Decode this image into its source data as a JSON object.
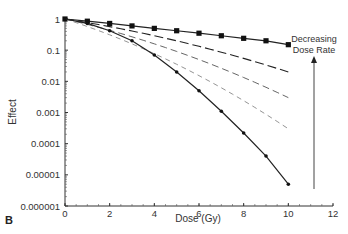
{
  "panel_label": "B",
  "chart_data": {
    "type": "line",
    "title": "",
    "xlabel": "Dose (Gy)",
    "ylabel": "Effect",
    "xlim": [
      0,
      12
    ],
    "ylim": [
      1e-06,
      1
    ],
    "yscale": "log",
    "grid": false,
    "x_ticks": [
      "0",
      "2",
      "4",
      "6",
      "8",
      "10",
      "12"
    ],
    "y_ticks": [
      "1",
      "0.1",
      "0.01",
      "0.001",
      "0.0001",
      "0.00001",
      "0.000001"
    ],
    "annotation": {
      "text_line1": "Decreasing",
      "text_line2": "Dose Rate",
      "arrow": "upward vertical arrow at x≈11.2 from bottom to top curve"
    },
    "series": [
      {
        "name": "lowest dose rate",
        "style": "solid, square markers",
        "x": [
          0,
          1,
          2,
          3,
          4,
          5,
          6,
          7,
          8,
          9,
          10
        ],
        "y": [
          1,
          0.85,
          0.72,
          0.6,
          0.5,
          0.42,
          0.35,
          0.29,
          0.24,
          0.2,
          0.15
        ]
      },
      {
        "name": "dose rate 2",
        "style": "long dash",
        "x": [
          0,
          10
        ],
        "y": [
          1,
          0.02
        ]
      },
      {
        "name": "dose rate 3",
        "style": "dash",
        "x": [
          0,
          10
        ],
        "y": [
          1,
          0.003
        ]
      },
      {
        "name": "dose rate 4",
        "style": "short dash",
        "x": [
          0,
          10
        ],
        "y": [
          1,
          0.0003
        ]
      },
      {
        "name": "highest dose rate (acute)",
        "style": "solid, diamond markers",
        "x": [
          0,
          1,
          2,
          3,
          4,
          5,
          6,
          7,
          8,
          9,
          10
        ],
        "y": [
          1,
          0.72,
          0.42,
          0.2,
          0.07,
          0.02,
          0.005,
          0.0011,
          0.00022,
          4e-05,
          5e-06
        ]
      }
    ]
  }
}
